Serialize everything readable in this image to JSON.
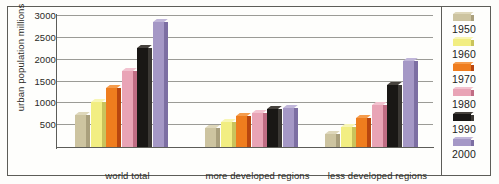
{
  "chart_data": {
    "type": "bar",
    "title": "",
    "xlabel": "",
    "ylabel": "urban population millions",
    "ylim": [
      0,
      3000
    ],
    "yticks": [
      "500",
      "1000",
      "1500",
      "2000",
      "2500",
      "3000"
    ],
    "ytick_values": [
      500,
      1000,
      1500,
      2000,
      2500,
      3000
    ],
    "grid": true,
    "legend_position": "right",
    "categories": [
      "world total",
      "more developed regions",
      "less developed regions"
    ],
    "series": [
      {
        "name": "1950",
        "color": "#cdc4a0",
        "side_color": "#a99f7c",
        "top_color": "#ded7ba",
        "values": [
          730,
          440,
          300
        ]
      },
      {
        "name": "1960",
        "color": "#f2ee82",
        "side_color": "#c9c35c",
        "top_color": "#f8f6b4",
        "values": [
          1020,
          570,
          460
        ]
      },
      {
        "name": "1970",
        "color": "#ef7d1e",
        "side_color": "#b8460f",
        "top_color": "#f59c4c",
        "values": [
          1350,
          700,
          670
        ]
      },
      {
        "name": "1980",
        "color": "#e9a4b6",
        "side_color": "#c06d84",
        "top_color": "#f2c2cf",
        "values": [
          1750,
          790,
          970
        ]
      },
      {
        "name": "1990",
        "color": "#191715",
        "side_color": "#3b3834",
        "top_color": "#46423d",
        "values": [
          2270,
          860,
          1420
        ]
      },
      {
        "name": "2000",
        "color": "#a598c6",
        "side_color": "#7d6fa3",
        "top_color": "#c0b6d9",
        "values": [
          2860,
          900,
          1970
        ]
      }
    ]
  },
  "legend": {
    "entries": [
      {
        "label": "1950"
      },
      {
        "label": "1960"
      },
      {
        "label": "1970"
      },
      {
        "label": "1980"
      },
      {
        "label": "1990"
      },
      {
        "label": "2000"
      }
    ]
  }
}
